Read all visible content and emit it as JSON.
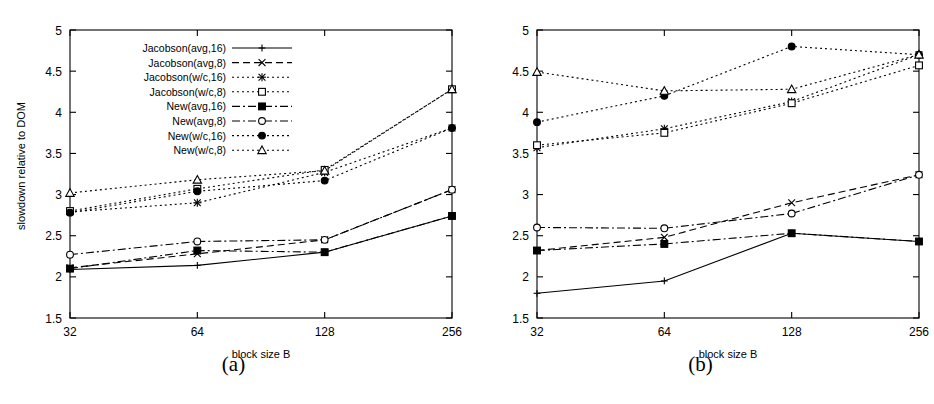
{
  "figure": {
    "panels": [
      {
        "id": "a",
        "caption": "(a)",
        "xlabel": "block size B",
        "ylabel": "slowdown relative to DOM",
        "has_legend": true
      },
      {
        "id": "b",
        "caption": "(b)",
        "xlabel": "block size B",
        "ylabel": "slowdown relative to DOM",
        "has_legend": false
      }
    ]
  },
  "chart_data": [
    {
      "type": "line",
      "panel": "a",
      "title": "(a)",
      "xlabel": "block size B",
      "ylabel": "slowdown relative to DOM",
      "categories": [
        "32",
        "64",
        "128",
        "256"
      ],
      "x": [
        32,
        64,
        128,
        256
      ],
      "xscale": "log2-categorical",
      "ylim": [
        1.5,
        5
      ],
      "yticks": [
        1.5,
        2,
        2.5,
        3,
        3.5,
        4,
        4.5,
        5
      ],
      "ytick_labels": [
        "1.5",
        "2",
        "2.5",
        "3",
        "3.5",
        "4",
        "4.5",
        "5"
      ],
      "grid": false,
      "legend_position": "top-left-inside",
      "series": [
        {
          "name": "Jacobson(avg,16)",
          "marker": "plus",
          "dash": "solid",
          "values": [
            2.09,
            2.14,
            2.3,
            2.74
          ]
        },
        {
          "name": "Jacobson(avg,8)",
          "marker": "cross",
          "dash": "dashed",
          "values": [
            2.11,
            2.28,
            2.45,
            3.06
          ]
        },
        {
          "name": "Jacobson(w/c,16)",
          "marker": "asterisk",
          "dash": "dotted",
          "values": [
            2.79,
            2.9,
            3.27,
            3.81
          ]
        },
        {
          "name": "Jacobson(w/c,8)",
          "marker": "open-square",
          "dash": "dotted",
          "values": [
            2.8,
            3.07,
            3.3,
            4.28
          ]
        },
        {
          "name": "New(avg,16)",
          "marker": "filled-square",
          "dash": "dash-dot",
          "values": [
            2.1,
            2.32,
            2.3,
            2.74
          ]
        },
        {
          "name": "New(avg,8)",
          "marker": "open-circle",
          "dash": "dash-dot",
          "values": [
            2.27,
            2.43,
            2.45,
            3.06
          ]
        },
        {
          "name": "New(w/c,16)",
          "marker": "filled-circle",
          "dash": "dotted",
          "values": [
            2.78,
            3.04,
            3.17,
            3.81
          ]
        },
        {
          "name": "New(w/c,8)",
          "marker": "open-triangle",
          "dash": "dotted",
          "values": [
            3.02,
            3.18,
            3.29,
            4.28
          ]
        }
      ]
    },
    {
      "type": "line",
      "panel": "b",
      "title": "(b)",
      "xlabel": "block size B",
      "ylabel": "slowdown relative to DOM",
      "categories": [
        "32",
        "64",
        "128",
        "256"
      ],
      "x": [
        32,
        64,
        128,
        256
      ],
      "xscale": "log2-categorical",
      "ylim": [
        1.5,
        5
      ],
      "yticks": [
        1.5,
        2,
        2.5,
        3,
        3.5,
        4,
        4.5,
        5
      ],
      "ytick_labels": [
        "1.5",
        "2",
        "2.5",
        "3",
        "3.5",
        "4",
        "4.5",
        "5"
      ],
      "grid": false,
      "legend_position": "none",
      "series": [
        {
          "name": "Jacobson(avg,16)",
          "marker": "plus",
          "dash": "solid",
          "values": [
            1.8,
            1.95,
            2.53,
            2.43
          ]
        },
        {
          "name": "Jacobson(avg,8)",
          "marker": "cross",
          "dash": "dashed",
          "values": [
            2.32,
            2.48,
            2.9,
            3.24
          ]
        },
        {
          "name": "Jacobson(w/c,16)",
          "marker": "asterisk",
          "dash": "dotted",
          "values": [
            3.57,
            3.8,
            4.13,
            4.7
          ]
        },
        {
          "name": "Jacobson(w/c,8)",
          "marker": "open-square",
          "dash": "dotted",
          "values": [
            3.6,
            3.75,
            4.11,
            4.57
          ]
        },
        {
          "name": "New(avg,16)",
          "marker": "filled-square",
          "dash": "dash-dot",
          "values": [
            2.32,
            2.4,
            2.53,
            2.43
          ]
        },
        {
          "name": "New(avg,8)",
          "marker": "open-circle",
          "dash": "dash-dot",
          "values": [
            2.6,
            2.59,
            2.77,
            3.24
          ]
        },
        {
          "name": "New(w/c,16)",
          "marker": "filled-circle",
          "dash": "dotted",
          "values": [
            3.88,
            4.2,
            4.8,
            4.7
          ]
        },
        {
          "name": "New(w/c,8)",
          "marker": "open-triangle",
          "dash": "dotted",
          "values": [
            4.49,
            4.26,
            4.28,
            4.7
          ]
        }
      ]
    }
  ]
}
